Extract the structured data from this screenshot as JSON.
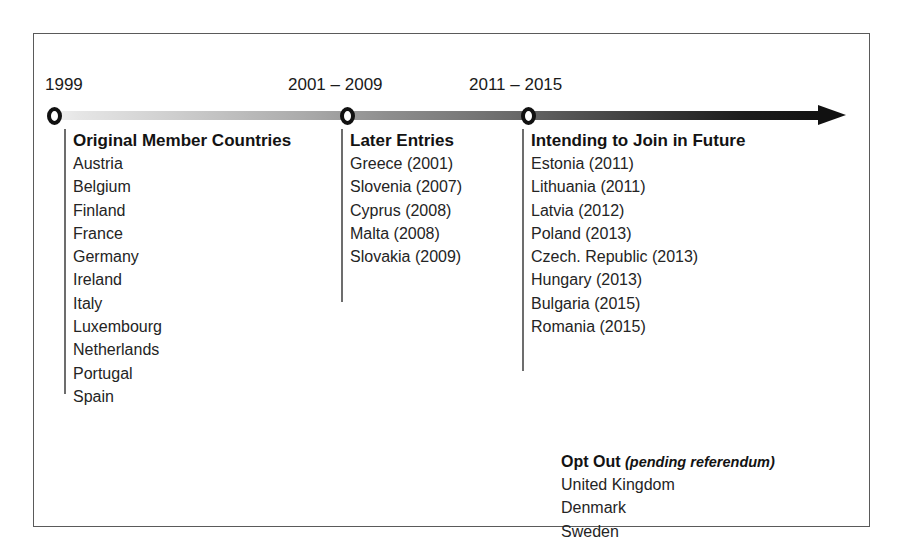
{
  "figure": {
    "type": "timeline",
    "title_visible": false,
    "border_color": "#5a5a5a",
    "axis": {
      "gradient_from": "#f2f2f2",
      "gradient_to": "#111111",
      "arrow_direction": "right",
      "markers": [
        {
          "label": "1999",
          "x": 13,
          "label_x": 11
        },
        {
          "label": "2001 – 2009",
          "x": 306,
          "label_x": 254
        },
        {
          "label": "2011 – 2015",
          "x": 487,
          "label_x": 435
        }
      ]
    }
  },
  "columns": [
    {
      "id": "original-members",
      "title": "Original Member Countries",
      "x": 30,
      "y": 95,
      "height": 265,
      "items": [
        "Austria",
        "Belgium",
        "Finland",
        "France",
        "Germany",
        "Ireland",
        "Italy",
        "Luxembourg",
        "Netherlands",
        "Portugal",
        "Spain"
      ]
    },
    {
      "id": "later-entries",
      "title": "Later Entries",
      "x": 307,
      "y": 95,
      "height": 173,
      "items": [
        "Greece (2001)",
        "Slovenia (2007)",
        "Cyprus (2008)",
        "Malta (2008)",
        "Slovakia (2009)"
      ]
    },
    {
      "id": "intending-to-join",
      "title": "Intending to Join in Future",
      "x": 488,
      "y": 95,
      "height": 242,
      "items": [
        "Estonia (2011)",
        "Lithuania (2011)",
        "Latvia (2012)",
        "Poland (2013)",
        "Czech. Republic (2013)",
        "Hungary (2013)",
        "Bulgaria (2015)",
        "Romania (2015)"
      ]
    }
  ],
  "opt_out": {
    "title": "Opt Out",
    "note": "(pending referendum)",
    "items": [
      "United Kingdom",
      "Denmark",
      "Sweden"
    ]
  }
}
